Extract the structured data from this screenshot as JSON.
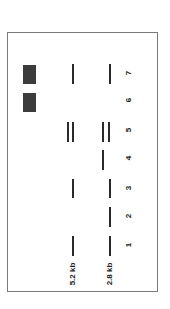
{
  "diagram": {
    "type": "gel-electrophoresis",
    "orientation": "rotated-90",
    "size_markers": [
      {
        "label": "5.2 kb",
        "x": 73
      },
      {
        "label": "2.8 kb",
        "x": 110
      }
    ],
    "lanes": [
      {
        "label": "1",
        "y_center": 245,
        "bands": [
          {
            "x": 72,
            "top": 236,
            "height": 20
          },
          {
            "x": 109,
            "top": 236,
            "height": 20
          }
        ],
        "blocks": []
      },
      {
        "label": "2",
        "y_center": 216,
        "bands": [
          {
            "x": 109,
            "top": 207,
            "height": 20
          }
        ],
        "blocks": []
      },
      {
        "label": "3",
        "y_center": 188,
        "bands": [
          {
            "x": 72,
            "top": 179,
            "height": 19
          },
          {
            "x": 109,
            "top": 179,
            "height": 19
          }
        ],
        "blocks": []
      },
      {
        "label": "4",
        "y_center": 158,
        "bands": [
          {
            "x": 102,
            "top": 150,
            "height": 20
          }
        ],
        "blocks": []
      },
      {
        "label": "5",
        "y_center": 130,
        "bands": [
          {
            "x": 67,
            "top": 122,
            "height": 20
          },
          {
            "x": 72,
            "top": 122,
            "height": 20
          },
          {
            "x": 102,
            "top": 122,
            "height": 20
          },
          {
            "x": 108,
            "top": 122,
            "height": 20
          }
        ],
        "blocks": []
      },
      {
        "label": "6",
        "y_center": 100,
        "bands": [],
        "blocks": [
          {
            "x": 23,
            "top": 93,
            "width": 13,
            "height": 19
          }
        ]
      },
      {
        "label": "7",
        "y_center": 73,
        "bands": [
          {
            "x": 72,
            "top": 64,
            "height": 20
          },
          {
            "x": 109,
            "top": 64,
            "height": 20
          }
        ],
        "blocks": [
          {
            "x": 23,
            "top": 65,
            "width": 13,
            "height": 19
          }
        ]
      }
    ],
    "colors": {
      "band": "#2a2a2a",
      "block": "#3c3c3c",
      "frame": "#7a7a7a"
    }
  }
}
